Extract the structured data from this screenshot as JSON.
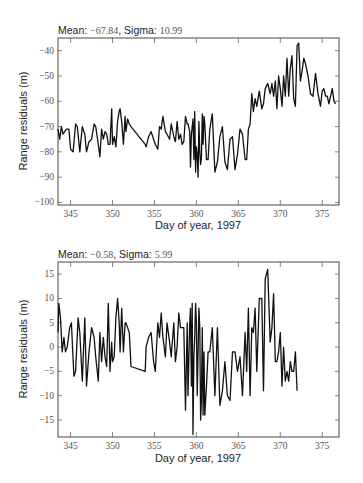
{
  "chart_data": [
    {
      "type": "line",
      "title_parts": {
        "mean_label": "Mean: ",
        "mean_value": "−67.84",
        "sep": ", ",
        "sigma_label": "Sigma: ",
        "sigma_value": "10.99"
      },
      "xlabel": "Day of year, 1997",
      "ylabel": "Range residuals (m)",
      "xlim": [
        343.5,
        377
      ],
      "ylim": [
        -101,
        -35
      ],
      "xticks": [
        345,
        350,
        355,
        360,
        365,
        370,
        375
      ],
      "yticks": [
        -40,
        -50,
        -60,
        -70,
        -80,
        -90,
        -100
      ],
      "ytick_labels": [
        "−40",
        "−50",
        "−60",
        "−70",
        "−80",
        "−90",
        "−100"
      ],
      "grid": false,
      "x": [
        343.5,
        343.7,
        343.9,
        344.1,
        344.3,
        344.5,
        344.8,
        345.0,
        345.3,
        345.6,
        345.8,
        346.1,
        346.4,
        346.7,
        346.9,
        347.2,
        347.5,
        347.8,
        348.0,
        348.3,
        348.5,
        348.7,
        348.9,
        349.1,
        349.3,
        349.5,
        349.7,
        349.9,
        350.0,
        350.2,
        350.4,
        350.6,
        350.8,
        350.9,
        351.1,
        351.3,
        351.5,
        351.6,
        351.8,
        352.0,
        352.2,
        353.9,
        354.0,
        354.3,
        354.6,
        354.9,
        355.1,
        355.4,
        355.6,
        355.8,
        356.0,
        356.3,
        356.5,
        356.8,
        357.0,
        357.3,
        357.5,
        357.7,
        357.9,
        358.1,
        358.3,
        358.5,
        358.7,
        358.9,
        359.0,
        359.2,
        359.3,
        359.4,
        359.5,
        359.6,
        359.7,
        359.8,
        359.9,
        360.0,
        360.1,
        360.2,
        360.3,
        360.4,
        360.5,
        360.6,
        360.7,
        360.8,
        360.9,
        361.0,
        361.2,
        361.4,
        361.6,
        361.9,
        362.2,
        362.5,
        362.8,
        363.1,
        363.4,
        363.7,
        364.0,
        364.3,
        364.6,
        364.9,
        365.2,
        365.5,
        365.8,
        366.0,
        366.2,
        366.4,
        366.6,
        366.8,
        367.0,
        367.2,
        367.5,
        367.8,
        368.0,
        368.2,
        368.5,
        368.8,
        369.0,
        369.2,
        369.4,
        369.6,
        369.8,
        370.0,
        370.2,
        370.4,
        370.6,
        370.8,
        371.0,
        371.2,
        371.4,
        371.6,
        371.8,
        372.0,
        372.2,
        372.4,
        372.6,
        372.8,
        373.0,
        373.3,
        373.6,
        373.9,
        374.2,
        374.5,
        374.8,
        375.0,
        375.2,
        375.4,
        375.6,
        375.8,
        376.0,
        376.2,
        376.4,
        376.6,
        376.8,
        377.0
      ],
      "y": [
        -71,
        -75,
        -70,
        -73,
        -72,
        -71,
        -71,
        -79,
        -80,
        -69,
        -70,
        -80,
        -70,
        -73,
        -80,
        -76,
        -75,
        -69,
        -70,
        -77,
        -82,
        -71,
        -75,
        -72,
        -73,
        -77,
        -77,
        -63,
        -77,
        -74,
        -78,
        -68,
        -64,
        -63,
        -68,
        -77,
        -66,
        -72,
        -67,
        -69,
        -70,
        -77,
        -78,
        -74,
        -72,
        -75,
        -77,
        -79,
        -70,
        -71,
        -66,
        -72,
        -73,
        -75,
        -69,
        -74,
        -76,
        -68,
        -75,
        -73,
        -77,
        -76,
        -66,
        -69,
        -69,
        -72,
        -86,
        -73,
        -70,
        -67,
        -83,
        -64,
        -88,
        -78,
        -81,
        -90,
        -68,
        -80,
        -85,
        -83,
        -65,
        -77,
        -66,
        -69,
        -83,
        -83,
        -71,
        -65,
        -88,
        -84,
        -74,
        -70,
        -84,
        -87,
        -75,
        -74,
        -87,
        -81,
        -71,
        -73,
        -83,
        -83,
        -71,
        -69,
        -57,
        -64,
        -59,
        -62,
        -56,
        -63,
        -61,
        -55,
        -53,
        -57,
        -53,
        -58,
        -52,
        -63,
        -50,
        -55,
        -62,
        -50,
        -58,
        -43,
        -58,
        -47,
        -42,
        -59,
        -62,
        -38,
        -37,
        -52,
        -48,
        -43,
        -45,
        -50,
        -57,
        -58,
        -49,
        -57,
        -62,
        -56,
        -55,
        -58,
        -58,
        -61,
        -58,
        -55,
        -60,
        -61
      ]
    },
    {
      "type": "line",
      "title_parts": {
        "mean_label": "Mean: ",
        "mean_value": "−0.58",
        "sep": ", ",
        "sigma_label": "Sigma: ",
        "sigma_value": "5.99"
      },
      "xlabel": "Day of year, 1997",
      "ylabel": "Range residuals (m)",
      "xlim": [
        343.5,
        377
      ],
      "ylim": [
        -18.5,
        17.5
      ],
      "xticks": [
        345,
        350,
        355,
        360,
        365,
        370,
        375
      ],
      "yticks": [
        15,
        10,
        5,
        0,
        -5,
        -10,
        -15
      ],
      "ytick_labels": [
        "15",
        "10",
        "5",
        "0",
        "−5",
        "−10",
        "−15"
      ],
      "grid": false,
      "x": [
        343.5,
        343.6,
        343.8,
        344.0,
        344.2,
        344.4,
        344.6,
        344.9,
        345.1,
        345.4,
        345.6,
        345.9,
        346.1,
        346.4,
        346.7,
        346.9,
        347.2,
        347.5,
        347.8,
        348.0,
        348.3,
        348.5,
        348.7,
        348.9,
        349.1,
        349.3,
        349.5,
        349.7,
        349.9,
        350.0,
        350.2,
        350.4,
        350.6,
        350.8,
        350.9,
        351.1,
        351.3,
        351.5,
        351.6,
        351.8,
        352.0,
        352.2,
        353.9,
        354.0,
        354.3,
        354.6,
        354.9,
        355.1,
        355.4,
        355.6,
        355.8,
        356.0,
        356.3,
        356.5,
        356.8,
        357.0,
        357.3,
        357.5,
        357.7,
        357.9,
        358.1,
        358.3,
        358.5,
        358.7,
        358.9,
        359.0,
        359.2,
        359.3,
        359.4,
        359.5,
        359.6,
        359.7,
        359.8,
        359.9,
        360.0,
        360.1,
        360.2,
        360.3,
        360.4,
        360.5,
        360.6,
        360.7,
        360.8,
        360.9,
        361.0,
        361.2,
        361.4,
        361.6,
        361.9,
        362.2,
        362.5,
        362.8,
        363.1,
        363.4,
        363.7,
        364.0,
        364.3,
        364.6,
        364.9,
        365.2,
        365.5,
        365.8,
        366.0,
        366.2,
        366.4,
        366.6,
        366.8,
        367.0,
        367.2,
        367.5,
        367.8,
        368.0,
        368.2,
        368.5,
        368.8,
        369.0,
        369.2,
        369.4,
        369.6,
        369.8,
        370.0,
        370.2,
        370.4,
        370.6,
        370.8,
        371.0,
        371.2,
        371.4,
        371.6,
        371.8,
        372.0,
        372.2,
        372.4,
        372.6,
        372.8,
        373.0,
        373.3,
        373.6,
        373.9,
        374.2,
        374.5,
        374.8,
        375.0,
        375.2,
        375.4,
        375.6,
        375.8,
        376.0,
        376.2,
        376.4,
        376.6,
        376.8,
        377.0
      ],
      "y": [
        3,
        9,
        6,
        -1,
        2,
        -1,
        0,
        4,
        5,
        -6,
        -5,
        6,
        3,
        -7,
        6,
        -8,
        -1,
        4,
        2,
        -2,
        -7,
        3,
        -3,
        2,
        -2,
        -4,
        9,
        -5,
        1,
        -3,
        -2,
        6,
        10,
        5,
        -1,
        8,
        -1,
        5,
        5,
        4,
        3,
        -4,
        -5,
        0,
        2,
        3,
        -3,
        -5,
        5,
        2,
        7,
        2,
        -2,
        5,
        1,
        -2,
        5,
        -3,
        0,
        7,
        4,
        4,
        4,
        -13,
        5,
        -10,
        5,
        8,
        -8,
        9,
        -18,
        -2,
        2,
        9,
        5,
        -10,
        -1,
        8,
        4,
        -15,
        -11,
        4,
        -14,
        -1,
        -14,
        -8,
        -1,
        -1,
        4,
        -10,
        4,
        -12,
        -9,
        -3,
        -10,
        -11,
        -1,
        -1,
        -5,
        -2,
        -10,
        3,
        -5,
        8,
        -10,
        4,
        3,
        8,
        -5,
        10,
        10,
        -9,
        14,
        16,
        1,
        4,
        11,
        -3,
        -3,
        -1,
        3,
        -8,
        0,
        -7,
        -5,
        -7,
        -3,
        -5,
        -5,
        -1,
        -9
      ]
    }
  ]
}
